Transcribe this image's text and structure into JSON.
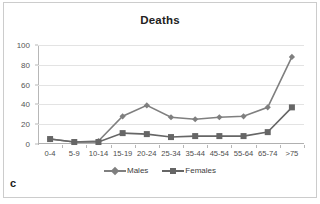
{
  "panel": {
    "letter": "c"
  },
  "chart_data": {
    "type": "line",
    "title": "Deaths",
    "xlabel": "",
    "ylabel": "",
    "ylim": [
      0,
      100
    ],
    "yticks": [
      0,
      20,
      40,
      60,
      80,
      100
    ],
    "grid": true,
    "legend_position": "bottom",
    "categories": [
      "0-4",
      "5-9",
      "10-14",
      "15-19",
      "20-24",
      "25-34",
      "35-44",
      "45-54",
      "55-64",
      "65-74",
      ">75"
    ],
    "series": [
      {
        "name": "Males",
        "color": "#7f7f7f",
        "marker": "diamond",
        "values": [
          5,
          2,
          3,
          28,
          39,
          27,
          25,
          27,
          28,
          37,
          88
        ]
      },
      {
        "name": "Females",
        "color": "#666666",
        "marker": "square",
        "values": [
          5,
          2,
          2,
          11,
          10,
          7,
          8,
          8,
          8,
          12,
          37
        ]
      }
    ]
  },
  "colors": {
    "gridline": "#e3e3e3",
    "axis": "#b7b7b7",
    "frame": "#cccccc",
    "title_text": "#222222",
    "tick_text": "#555555"
  }
}
